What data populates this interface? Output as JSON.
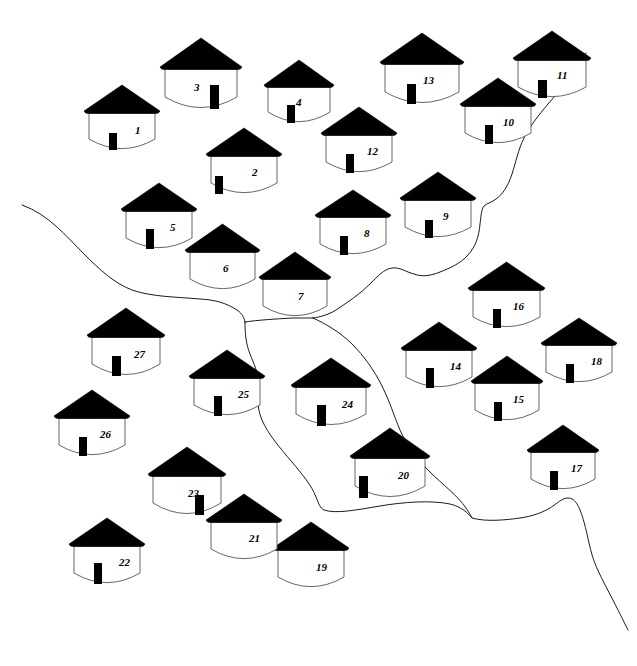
{
  "map": {
    "title": "Village Hut Distribution Map",
    "width": 637,
    "height": 666,
    "background_color": "#ffffff",
    "ink_color": "#000000",
    "river_color": "#000000",
    "hut_count": 27,
    "river_count": 5
  },
  "legend": {
    "roof_color": "#000000",
    "wall_color": "#ffffff",
    "wall_outline_color": "#555555",
    "door_color": "#000000"
  },
  "huts": [
    {
      "id": "1",
      "label": "1",
      "x": 83,
      "y": 85,
      "w": 66,
      "roof_h": 28,
      "body_h": 37,
      "door": "center-left",
      "door_h": 17,
      "label_dx": 0.7,
      "label_dy": 0.32
    },
    {
      "id": "2",
      "label": "2",
      "x": 205,
      "y": 128,
      "w": 66,
      "roof_h": 28,
      "body_h": 38,
      "door": "far-left",
      "door_h": 18,
      "label_dx": 0.62,
      "label_dy": 0.3
    },
    {
      "id": "3",
      "label": "3",
      "x": 159,
      "y": 38,
      "w": 72,
      "roof_h": 31,
      "body_h": 40,
      "door": "right",
      "door_h": 24,
      "label_dx": 0.4,
      "label_dy": 0.32
    },
    {
      "id": "4",
      "label": "4",
      "x": 263,
      "y": 60,
      "w": 62,
      "roof_h": 27,
      "body_h": 36,
      "door": "center-left",
      "door_h": 18,
      "label_dx": 0.45,
      "label_dy": 0.28
    },
    {
      "id": "5",
      "label": "5",
      "x": 120,
      "y": 183,
      "w": 66,
      "roof_h": 28,
      "body_h": 38,
      "door": "center-left",
      "door_h": 20,
      "label_dx": 0.66,
      "label_dy": 0.3
    },
    {
      "id": "6",
      "label": "6",
      "x": 184,
      "y": 224,
      "w": 65,
      "roof_h": 28,
      "body_h": 38,
      "door": "none",
      "door_h": 0,
      "label_dx": 0.5,
      "label_dy": 0.3
    },
    {
      "id": "7",
      "label": "7",
      "x": 258,
      "y": 252,
      "w": 64,
      "roof_h": 27,
      "body_h": 38,
      "door": "none",
      "door_h": 0,
      "label_dx": 0.55,
      "label_dy": 0.32
    },
    {
      "id": "8",
      "label": "8",
      "x": 314,
      "y": 190,
      "w": 66,
      "roof_h": 27,
      "body_h": 38,
      "door": "center-left",
      "door_h": 19,
      "label_dx": 0.66,
      "label_dy": 0.3
    },
    {
      "id": "9",
      "label": "9",
      "x": 399,
      "y": 172,
      "w": 66,
      "roof_h": 28,
      "body_h": 38,
      "door": "center-left",
      "door_h": 18,
      "label_dx": 0.58,
      "label_dy": 0.28
    },
    {
      "id": "10",
      "label": "10",
      "x": 459,
      "y": 78,
      "w": 66,
      "roof_h": 28,
      "body_h": 38,
      "door": "center-left",
      "door_h": 19,
      "label_dx": 0.58,
      "label_dy": 0.28
    },
    {
      "id": "11",
      "label": "11",
      "x": 512,
      "y": 31,
      "w": 68,
      "roof_h": 29,
      "body_h": 38,
      "door": "center-left",
      "door_h": 18,
      "label_dx": 0.58,
      "label_dy": 0.26
    },
    {
      "id": "12",
      "label": "12",
      "x": 320,
      "y": 107,
      "w": 66,
      "roof_h": 28,
      "body_h": 38,
      "door": "center-left",
      "door_h": 19,
      "label_dx": 0.62,
      "label_dy": 0.3
    },
    {
      "id": "13",
      "label": "13",
      "x": 379,
      "y": 33,
      "w": 74,
      "roof_h": 31,
      "body_h": 40,
      "door": "center-left",
      "door_h": 20,
      "label_dx": 0.52,
      "label_dy": 0.28
    },
    {
      "id": "14",
      "label": "14",
      "x": 400,
      "y": 322,
      "w": 66,
      "roof_h": 28,
      "body_h": 38,
      "door": "center-left",
      "door_h": 20,
      "label_dx": 0.66,
      "label_dy": 0.3
    },
    {
      "id": "15",
      "label": "15",
      "x": 470,
      "y": 356,
      "w": 64,
      "roof_h": 27,
      "body_h": 38,
      "door": "center-left",
      "door_h": 19,
      "label_dx": 0.6,
      "label_dy": 0.3
    },
    {
      "id": "16",
      "label": "16",
      "x": 467,
      "y": 262,
      "w": 67,
      "roof_h": 28,
      "body_h": 38,
      "door": "center-left",
      "door_h": 19,
      "label_dx": 0.6,
      "label_dy": 0.28
    },
    {
      "id": "17",
      "label": "17",
      "x": 526,
      "y": 425,
      "w": 64,
      "roof_h": 27,
      "body_h": 38,
      "door": "center-left",
      "door_h": 19,
      "label_dx": 0.62,
      "label_dy": 0.3
    },
    {
      "id": "18",
      "label": "18",
      "x": 540,
      "y": 318,
      "w": 66,
      "roof_h": 27,
      "body_h": 38,
      "door": "center-left",
      "door_h": 19,
      "label_dx": 0.68,
      "label_dy": 0.3
    },
    {
      "id": "19",
      "label": "19",
      "x": 272,
      "y": 522,
      "w": 66,
      "roof_h": 28,
      "body_h": 38,
      "door": "none",
      "door_h": 0,
      "label_dx": 0.57,
      "label_dy": 0.32
    },
    {
      "id": "20",
      "label": "20",
      "x": 349,
      "y": 428,
      "w": 70,
      "roof_h": 30,
      "body_h": 40,
      "door": "far-left",
      "door_h": 22,
      "label_dx": 0.62,
      "label_dy": 0.3
    },
    {
      "id": "21",
      "label": "21",
      "x": 205,
      "y": 494,
      "w": 66,
      "roof_h": 28,
      "body_h": 38,
      "door": "none",
      "door_h": 0,
      "label_dx": 0.57,
      "label_dy": 0.3
    },
    {
      "id": "22",
      "label": "22",
      "x": 68,
      "y": 518,
      "w": 66,
      "roof_h": 28,
      "body_h": 38,
      "door": "center-left",
      "door_h": 21,
      "label_dx": 0.68,
      "label_dy": 0.3
    },
    {
      "id": "23",
      "label": "23",
      "x": 147,
      "y": 447,
      "w": 68,
      "roof_h": 29,
      "body_h": 39,
      "door": "right",
      "door_h": 20,
      "label_dx": 0.52,
      "label_dy": 0.32
    },
    {
      "id": "24",
      "label": "24",
      "x": 290,
      "y": 358,
      "w": 70,
      "roof_h": 29,
      "body_h": 39,
      "door": "center-left",
      "door_h": 21,
      "label_dx": 0.66,
      "label_dy": 0.3
    },
    {
      "id": "25",
      "label": "25",
      "x": 188,
      "y": 350,
      "w": 66,
      "roof_h": 28,
      "body_h": 38,
      "door": "center-left",
      "door_h": 20,
      "label_dx": 0.66,
      "label_dy": 0.3
    },
    {
      "id": "26",
      "label": "26",
      "x": 53,
      "y": 390,
      "w": 66,
      "roof_h": 28,
      "body_h": 38,
      "door": "center-left",
      "door_h": 19,
      "label_dx": 0.62,
      "label_dy": 0.3
    },
    {
      "id": "27",
      "label": "27",
      "x": 86,
      "y": 308,
      "w": 68,
      "roof_h": 29,
      "body_h": 39,
      "door": "center-left",
      "door_h": 20,
      "label_dx": 0.62,
      "label_dy": 0.3
    }
  ],
  "rivers": [
    {
      "name": "west-branch",
      "description": "Stream entering from left edge, flowing south-east to the central junction",
      "path": "M 22 205 C 48 214, 66 236, 84 254 C 100 270, 114 283, 132 290 C 152 297, 178 297, 200 299 C 216 300, 226 303, 237 310 C 243 314, 244 318, 245 322"
    },
    {
      "name": "northeast-branch",
      "description": "Stream entering from the top edge near hut 11, flowing south-west to the central junction",
      "path": "M 586 53 C 576 70, 562 88, 548 104 C 538 116, 530 126, 524 138 C 518 150, 516 162, 512 174 C 508 186, 503 194, 496 199 C 491 203, 487 203, 484 206 C 481 210, 481 217, 480 224 C 479 236, 476 246, 468 255 C 460 264, 450 268, 440 272 C 430 276, 422 277, 414 274 C 406 272, 400 267, 392 268 C 384 269, 378 276, 370 284 C 360 294, 348 302, 336 310 C 328 315, 320 317, 313 318"
    },
    {
      "name": "junction-link",
      "description": "Short horizontal reach connecting west branch to the main junction node",
      "path": "M 245 322 C 258 320, 276 319, 292 318 C 300 318, 307 318, 313 318"
    },
    {
      "name": "south-west-branch",
      "description": "Distributary flowing south from the junction, curving east at the bottom to rejoin",
      "path": "M 245 322 C 245 334, 246 344, 250 354 C 254 364, 258 372, 258 382 C 258 394, 256 406, 262 420 C 268 434, 280 448, 292 462 C 302 474, 312 486, 316 497 C 319 504, 320 508, 324 510 C 336 514, 356 510, 380 506 C 404 502, 430 500, 450 504 C 462 507, 468 513, 472 518"
    },
    {
      "name": "south-east-branch",
      "description": "Distributary flowing south-east from the junction to the lower-right edge",
      "path": "M 313 318 C 326 324, 340 332, 352 344 C 364 356, 374 370, 382 386 C 390 402, 394 416, 400 430 C 406 444, 416 458, 430 472 C 442 484, 458 496, 466 508 C 470 514, 471 516, 472 518 C 486 522, 506 520, 520 518 C 534 516, 543 512, 550 508 C 558 503, 562 498, 568 498 C 576 498, 580 508, 584 522 C 588 536, 590 552, 596 566 C 602 580, 610 594, 616 606 C 622 618, 626 626, 628 630"
    }
  ]
}
